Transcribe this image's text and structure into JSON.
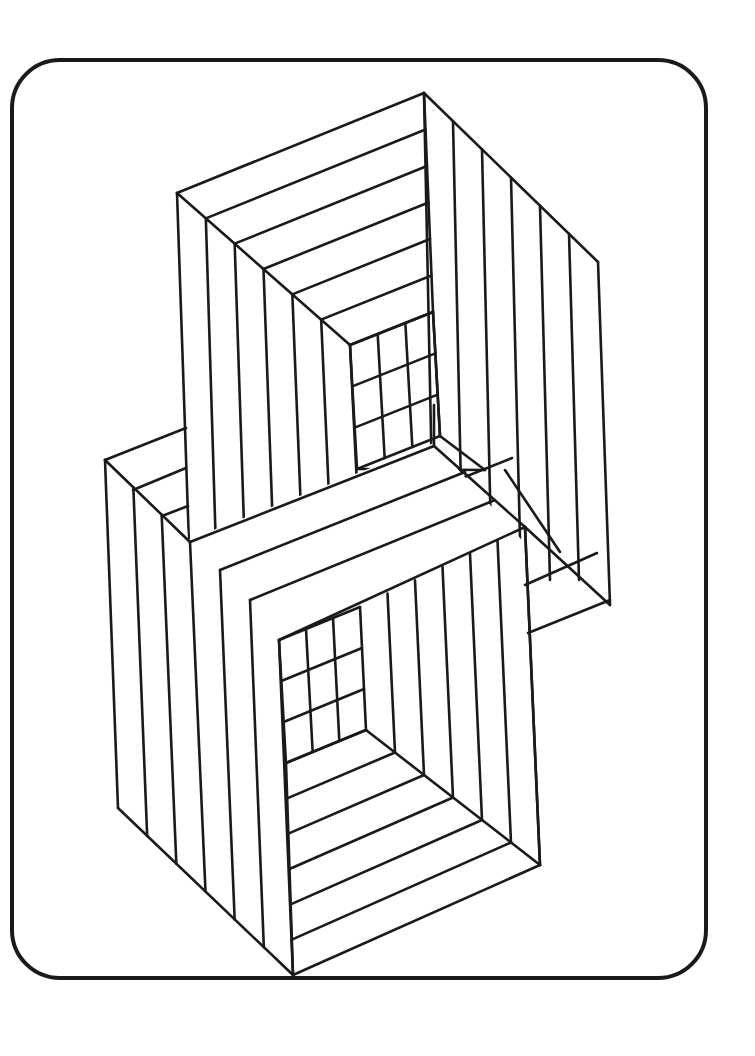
{
  "page": {
    "background": "#ffffff",
    "ink": "#1a1a1a"
  },
  "frame": {
    "x": 12,
    "y": 60,
    "w": 694,
    "h": 918,
    "r": 48
  },
  "upper_box": {
    "name": "upper-box",
    "outer": {
      "tl": [
        177,
        193
      ],
      "tr": [
        424,
        93
      ],
      "rc": [
        598,
        262
      ],
      "rb": [
        610,
        605
      ]
    },
    "inner_grid": {
      "tl": [
        350,
        345
      ],
      "tr": [
        433,
        312
      ],
      "br": [
        440,
        436
      ],
      "bl": [
        357,
        469
      ],
      "rows": 3,
      "cols": 3
    },
    "frames": 6
  },
  "lower_box": {
    "name": "lower-box",
    "outer": {
      "tl": [
        105,
        460
      ],
      "bl": [
        118,
        808
      ],
      "bc": [
        293,
        975
      ],
      "br": [
        540,
        865
      ]
    },
    "inner_grid": {
      "tl": [
        279,
        640
      ],
      "tr": [
        360,
        607
      ],
      "br": [
        366,
        730
      ],
      "bl": [
        286,
        763
      ],
      "rows": 3,
      "cols": 3
    },
    "frames": 6
  },
  "bridge": {
    "name": "bridge-slab",
    "top": [
      [
        190,
        542
      ],
      [
        434,
        446
      ]
    ],
    "mid": [
      [
        220,
        570
      ],
      [
        465,
        472
      ]
    ],
    "bottom": [
      [
        250,
        600
      ],
      [
        495,
        500
      ]
    ],
    "bottom2": [
      [
        278,
        628
      ],
      [
        525,
        527
      ]
    ]
  }
}
